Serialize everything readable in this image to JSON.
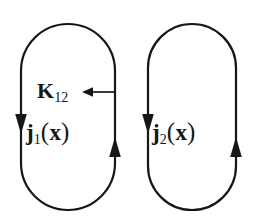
{
  "figure": {
    "background_color": "#ffffff",
    "stroke_color": "#161616",
    "stroke_width": 2.2
  },
  "loops": [
    {
      "name": "loop-1",
      "label_main": "j",
      "label_sub": "1",
      "label_arg_open": "(",
      "label_arg": "x",
      "label_arg_close": ")",
      "left_stem_x": 21,
      "right_stem_x": 115,
      "top_y": 24,
      "bottom_y": 210,
      "corner_radius": 47,
      "left_arrow_direction": "down",
      "right_arrow_direction": "up",
      "left_arrow_tip_y": 133,
      "right_arrow_tip_y": 137
    },
    {
      "name": "loop-2",
      "label_main": "j",
      "label_sub": "2",
      "label_arg_open": "(",
      "label_arg": "x",
      "label_arg_close": ")",
      "left_stem_x": 148,
      "right_stem_x": 236,
      "top_y": 24,
      "bottom_y": 210,
      "corner_radius": 44,
      "left_arrow_direction": "down",
      "right_arrow_direction": "up",
      "left_arrow_tip_y": 133,
      "right_arrow_tip_y": 137
    }
  ],
  "coupling": {
    "label_main": "K",
    "label_sub": "12",
    "arrow_direction": "left",
    "arrow_from_x": 115,
    "arrow_to_x": 82,
    "arrow_y": 92
  }
}
